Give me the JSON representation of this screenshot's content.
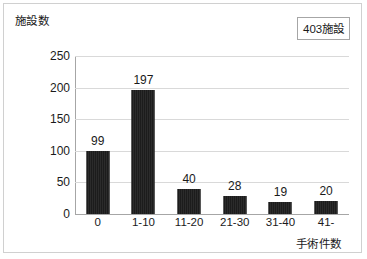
{
  "badge": {
    "label": "403施設"
  },
  "chart_data": {
    "type": "bar",
    "title": "",
    "categories": [
      "0",
      "1-10",
      "11-20",
      "21-30",
      "31-40",
      "41-"
    ],
    "values": [
      99,
      197,
      40,
      28,
      19,
      20
    ],
    "data_labels": [
      "99",
      "197",
      "40",
      "28",
      "19",
      "20"
    ],
    "xlabel": "手術件数",
    "ylabel": "施設数",
    "ylim": [
      0,
      250
    ],
    "yticks": [
      0,
      50,
      100,
      150,
      200,
      250
    ],
    "ytick_labels": [
      "0",
      "50",
      "100",
      "150",
      "200",
      "250"
    ],
    "grid": "horizontal",
    "legend": "none",
    "bar_color": "#262626",
    "gridline_color": "#d9d9d9",
    "axis_color": "#a6a6a6",
    "annotation": "403施設"
  }
}
